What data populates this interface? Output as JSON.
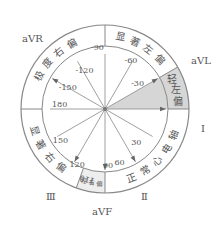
{
  "center": {
    "x": 105,
    "y": 109
  },
  "radii": {
    "outer": 84,
    "inner": 63
  },
  "colors": {
    "line": "#888888",
    "text": "#555555",
    "shade": "#d6d6d6"
  },
  "leads": [
    {
      "name": "aVR",
      "label": "aVR",
      "x": 22,
      "y": 42
    },
    {
      "name": "aVL",
      "label": "aVL",
      "x": 191,
      "y": 64
    },
    {
      "name": "I",
      "label": "I",
      "x": 201,
      "y": 132
    },
    {
      "name": "II",
      "label": "Ⅱ",
      "x": 141,
      "y": 200
    },
    {
      "name": "III",
      "label": "Ⅲ",
      "x": 46,
      "y": 200
    },
    {
      "name": "aVF",
      "label": "aVF",
      "x": 92,
      "y": 215
    }
  ],
  "degree_labels": [
    {
      "label": "-90",
      "angle": -90
    },
    {
      "label": "-60",
      "angle": -60
    },
    {
      "label": "-30",
      "angle": -30
    },
    {
      "label": "30",
      "angle": 30
    },
    {
      "label": "60",
      "angle": 60
    },
    {
      "label": "90",
      "angle": 90
    },
    {
      "label": "120",
      "angle": 120
    },
    {
      "label": "150",
      "angle": 150
    },
    {
      "label": "180",
      "angle": 180
    },
    {
      "label": "-120",
      "angle": -120
    },
    {
      "label": "-150",
      "angle": -150
    },
    {
      "label": "110",
      "angle": 110
    }
  ],
  "zones": [
    {
      "name": "extreme-right-deviation",
      "label": "极度右偏",
      "from": -180,
      "to": -90
    },
    {
      "name": "marked-left-deviation",
      "label": "显著左偏",
      "from": -90,
      "to": -30
    },
    {
      "name": "mild-left-deviation",
      "label": "轻左偏",
      "from": -30,
      "to": 0
    },
    {
      "name": "normal-axis",
      "label": "正常心电轴",
      "from": 0,
      "to": 90
    },
    {
      "name": "mild-right-deviation",
      "label": "轻右偏",
      "from": 90,
      "to": 110
    },
    {
      "name": "marked-right-deviation",
      "label": "显著右偏",
      "from": 110,
      "to": 180
    }
  ]
}
